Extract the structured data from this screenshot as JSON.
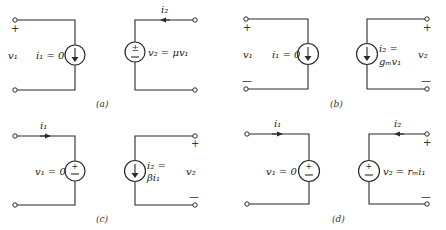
{
  "panels": [
    {
      "id": "a",
      "caption": "(a)",
      "input_port": {
        "voltage": "v1",
        "plus": "+",
        "minus": "",
        "source_label": "i1 = 0",
        "source_type": "current-source"
      },
      "output_port": {
        "current": "i2",
        "source_label": "v2 = μv1",
        "source_type": "voltage-source",
        "plus": "",
        "minus": ""
      }
    },
    {
      "id": "b",
      "caption": "(b)",
      "input_port": {
        "voltage": "v1",
        "plus": "+",
        "minus": "—",
        "source_label": "i1 = 0",
        "source_type": "current-source"
      },
      "output_port": {
        "voltage": "v2",
        "plus": "+",
        "minus": "—",
        "source_label_line1": "i2 =",
        "source_label_line2": "gm v1",
        "source_type": "current-source"
      }
    },
    {
      "id": "c",
      "caption": "(c)",
      "input_port": {
        "current": "i1",
        "source_label": "v1 = 0",
        "source_type": "voltage-source"
      },
      "output_port": {
        "voltage": "v2",
        "plus": "+",
        "minus": "—",
        "source_label_line1": "i2 =",
        "source_label_line2": "βi1",
        "source_type": "current-source"
      }
    },
    {
      "id": "d",
      "caption": "(d)",
      "input_port": {
        "current": "i1",
        "source_label": "v1 = 0",
        "source_type": "voltage-source"
      },
      "output_port": {
        "current": "i2",
        "plus": "+",
        "minus": "—",
        "source_label": "v2 = rm i1",
        "source_type": "voltage-source"
      }
    }
  ],
  "text": {
    "a_v1": "v₁",
    "a_plus": "+",
    "a_i1": "i₁ = 0",
    "a_i2": "i₂",
    "a_v2": "v₂ = μv₁",
    "a_cap": "(a)",
    "b_v1": "v₁",
    "b_plus1": "+",
    "b_minus1": "—",
    "b_i1": "i₁ = 0",
    "b_i2a": "i₂ =",
    "b_i2b": "gₘv₁",
    "b_v2": "v₂",
    "b_plus2": "+",
    "b_minus2": "—",
    "b_cap": "(b)",
    "c_i1": "i₁",
    "c_v1": "v₁ = 0",
    "c_i2a": "i₂ =",
    "c_i2b": "βi₁",
    "c_v2": "v₂",
    "c_plus2": "+",
    "c_minus2": "—",
    "c_cap": "(c)",
    "d_i1": "i₁",
    "d_v1": "v₁ = 0",
    "d_i2": "i₂",
    "d_v2": "v₂ = rₘi₁",
    "d_plus2": "+",
    "d_minus2": "—",
    "d_cap": "(d)"
  }
}
